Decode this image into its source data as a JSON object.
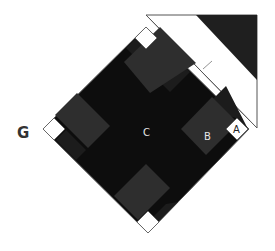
{
  "diagram": {
    "title_letter": "G",
    "labels": {
      "a": "A",
      "b": "B",
      "c": "C"
    },
    "colors": {
      "background": "#ffffff",
      "center": "#0d0d0d",
      "rectangles": "#2e2e2e",
      "small_rectangles": "#1c1c1c",
      "corner_squares": "#ffffff",
      "outline": "#555555",
      "triangle_fill": "#1f1f1f"
    }
  }
}
